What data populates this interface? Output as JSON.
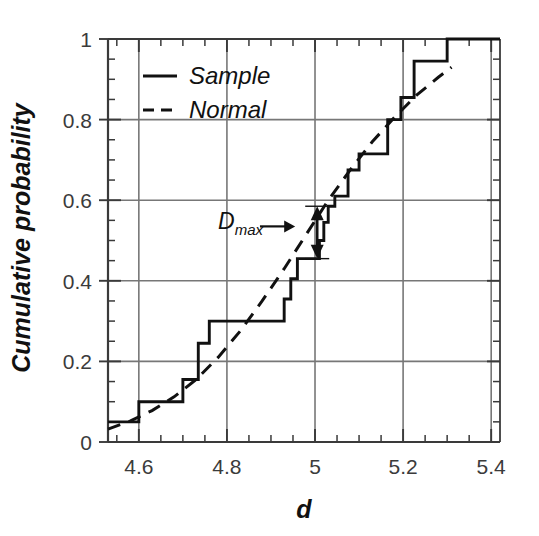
{
  "chart_data": {
    "type": "line",
    "title": "",
    "xlabel": "d",
    "ylabel": "Cumulative probability",
    "xlim": [
      4.53,
      5.42
    ],
    "ylim": [
      0,
      1
    ],
    "grid": true,
    "xticks": [
      4.6,
      4.8,
      5.0,
      5.2,
      5.4
    ],
    "xtick_labels": [
      "4.6",
      "4.8",
      "5",
      "5.2",
      "5.4"
    ],
    "yticks": [
      0,
      0.2,
      0.4,
      0.6,
      0.8,
      1
    ],
    "ytick_labels": [
      "0",
      "0.2",
      "0.4",
      "0.6",
      "0.8",
      "1"
    ],
    "x_minor_step": 0.05,
    "y_minor_step": 0.05,
    "legend_position": "upper-left-inside",
    "series": [
      {
        "name": "Sample",
        "style": "solid",
        "drawstyle": "steps-post",
        "color": "#111111",
        "x": [
          4.53,
          4.6,
          4.6,
          4.7,
          4.7,
          4.735,
          4.735,
          4.76,
          4.76,
          4.93,
          4.93,
          4.945,
          4.945,
          4.96,
          4.96,
          5.01,
          5.01,
          5.02,
          5.02,
          5.03,
          5.03,
          5.045,
          5.045,
          5.075,
          5.075,
          5.1,
          5.1,
          5.165,
          5.165,
          5.195,
          5.195,
          5.225,
          5.225,
          5.3,
          5.3,
          5.42
        ],
        "y": [
          0.05,
          0.05,
          0.1,
          0.1,
          0.155,
          0.155,
          0.245,
          0.245,
          0.3,
          0.3,
          0.355,
          0.355,
          0.405,
          0.405,
          0.455,
          0.455,
          0.5,
          0.5,
          0.545,
          0.545,
          0.585,
          0.585,
          0.61,
          0.61,
          0.675,
          0.675,
          0.715,
          0.715,
          0.8,
          0.8,
          0.855,
          0.855,
          0.945,
          0.945,
          1.0,
          1.0
        ]
      },
      {
        "name": "Normal",
        "style": "dashed",
        "drawstyle": "smooth",
        "color": "#111111",
        "x": [
          4.53,
          4.58,
          4.63,
          4.68,
          4.73,
          4.78,
          4.83,
          4.88,
          4.93,
          4.98,
          5.03,
          5.08,
          5.13,
          5.18,
          5.23,
          5.28,
          5.31
        ],
        "y": [
          0.032,
          0.052,
          0.078,
          0.112,
          0.155,
          0.21,
          0.275,
          0.35,
          0.43,
          0.515,
          0.6,
          0.675,
          0.745,
          0.805,
          0.86,
          0.905,
          0.93
        ]
      }
    ],
    "annotations": [
      {
        "name": "d-max",
        "label": "D",
        "subscript": "max",
        "text_x": 4.78,
        "text_y": 0.528,
        "pointer_arrow": {
          "from_x": 4.875,
          "to_x": 4.955,
          "y": 0.535
        },
        "double_arrow": {
          "x": 5.005,
          "y_low": 0.455,
          "y_high": 0.585
        }
      }
    ]
  },
  "legend": {
    "items": [
      {
        "label": "Sample",
        "style": "solid"
      },
      {
        "label": "Normal",
        "style": "dashed"
      }
    ]
  },
  "axes": {
    "x_title": "d",
    "y_title": "Cumulative probability"
  },
  "colors": {
    "data": "#111111",
    "grid": "#777777",
    "axis": "#3a3a3a",
    "tick_text": "#3b3b3b",
    "background": "#ffffff"
  }
}
